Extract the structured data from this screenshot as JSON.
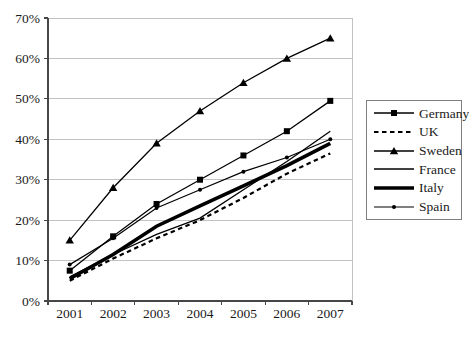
{
  "chart_data": {
    "type": "line",
    "title": "",
    "xlabel": "",
    "ylabel": "",
    "categories": [
      "2001",
      "2002",
      "2003",
      "2004",
      "2005",
      "2006",
      "2007"
    ],
    "ytick_labels": [
      "0%",
      "10%",
      "20%",
      "30%",
      "40%",
      "50%",
      "60%",
      "70%"
    ],
    "ylim": [
      0,
      70
    ],
    "grid": "horizontal",
    "legend_position": "right",
    "series": [
      {
        "name": "Germany",
        "values": [
          7.5,
          16,
          24,
          30,
          36,
          42,
          49.5
        ],
        "marker": "square",
        "dash": false,
        "line_width": 1.3
      },
      {
        "name": "UK",
        "values": [
          5,
          10.5,
          15.5,
          20,
          25.5,
          31.5,
          36.5
        ],
        "marker": "none",
        "dash": true,
        "line_width": 2.2
      },
      {
        "name": "Sweden",
        "values": [
          15,
          28,
          39,
          47,
          54,
          60,
          65
        ],
        "marker": "triangle",
        "dash": false,
        "line_width": 1.3
      },
      {
        "name": "France",
        "values": [
          6,
          11.5,
          16.5,
          20.5,
          27.5,
          34.5,
          42
        ],
        "marker": "none",
        "dash": false,
        "line_width": 1.3
      },
      {
        "name": "Italy",
        "values": [
          5.5,
          11.5,
          18.5,
          23.5,
          28.5,
          33.5,
          39
        ],
        "marker": "none",
        "dash": false,
        "line_width": 3.6
      },
      {
        "name": "Spain",
        "values": [
          9,
          15.5,
          23,
          27.5,
          32,
          35.5,
          40
        ],
        "marker": "dot",
        "dash": false,
        "line_width": 1.2
      }
    ],
    "colors": {
      "series": "#000000",
      "grid": "#c2c2c2",
      "axis": "#474747",
      "text": "#1a1a1a",
      "plot_border": "#c2c2c2",
      "background": "#ffffff"
    }
  }
}
